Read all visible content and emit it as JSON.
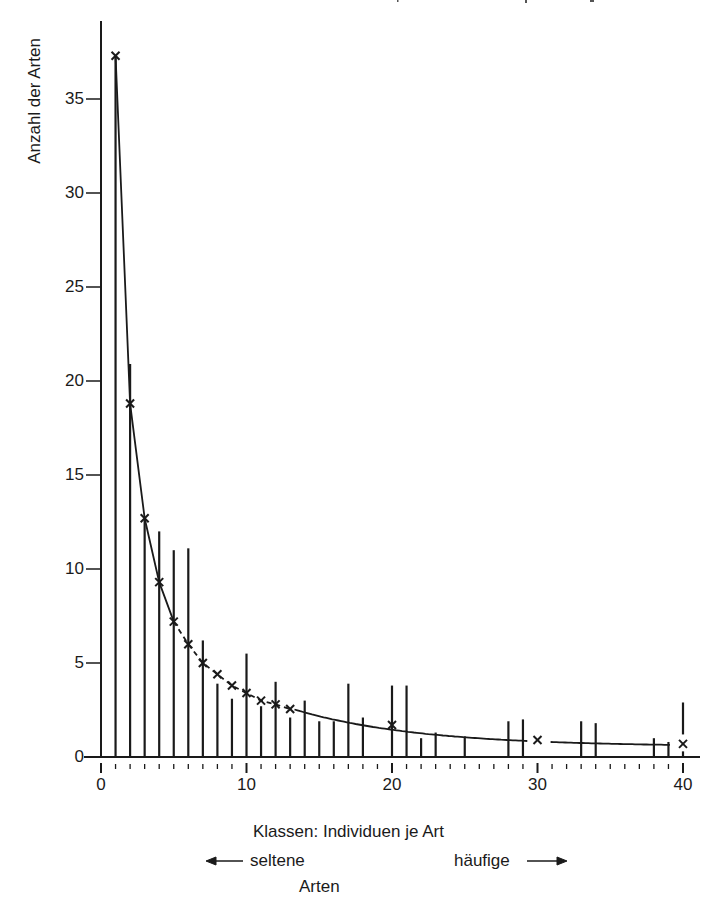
{
  "chart_data": {
    "type": "bar",
    "title": "",
    "xlabel": "Klassen: Individuen je Art",
    "xlabel_sub_left": "seltene",
    "xlabel_sub_right": "häufige",
    "xlabel_bottom": "Arten",
    "ylabel": "Anzahl der Arten",
    "xlim": [
      0,
      40
    ],
    "ylim": [
      0,
      38
    ],
    "x_ticks": [
      0,
      10,
      20,
      30,
      40
    ],
    "x_minor_tick_step": 1,
    "y_ticks": [
      0,
      5,
      10,
      15,
      20,
      25,
      30,
      35
    ],
    "grid": false,
    "legend": null,
    "series": [
      {
        "name": "observed (bars)",
        "type": "bar",
        "x": [
          1,
          2,
          3,
          4,
          5,
          6,
          7,
          8,
          9,
          10,
          11,
          12,
          13,
          14,
          15,
          16,
          17,
          18,
          20,
          21,
          22,
          23,
          25,
          28,
          29,
          33,
          34,
          38,
          39,
          40
        ],
        "values": [
          37.3,
          20.9,
          12.6,
          12.0,
          11.0,
          11.1,
          6.2,
          3.9,
          3.1,
          5.5,
          2.7,
          4.0,
          2.1,
          3.0,
          1.9,
          1.9,
          3.9,
          2.1,
          3.8,
          3.8,
          1.0,
          1.3,
          1.1,
          1.9,
          2.0,
          1.9,
          1.8,
          1.0,
          0.8,
          2.9
        ]
      },
      {
        "name": "fitted (x markers)",
        "type": "line",
        "x": [
          1,
          2,
          3,
          4,
          5,
          6,
          7,
          8,
          9,
          10,
          11,
          12,
          13,
          20,
          30,
          40
        ],
        "values": [
          37.3,
          18.8,
          12.7,
          9.3,
          7.2,
          6.0,
          5.0,
          4.4,
          3.8,
          3.4,
          3.0,
          2.8,
          2.55,
          1.7,
          0.9,
          0.7
        ],
        "line_style": "solid 1–5, dashed 5–13, solid 13–40"
      }
    ]
  },
  "labels": {
    "ylabel": "Anzahl der Arten",
    "xcaption": "Klassen:   Individuen je Art",
    "left_arrow_text": "seltene",
    "right_arrow_text": "häufige",
    "bottom_text": "Arten"
  }
}
